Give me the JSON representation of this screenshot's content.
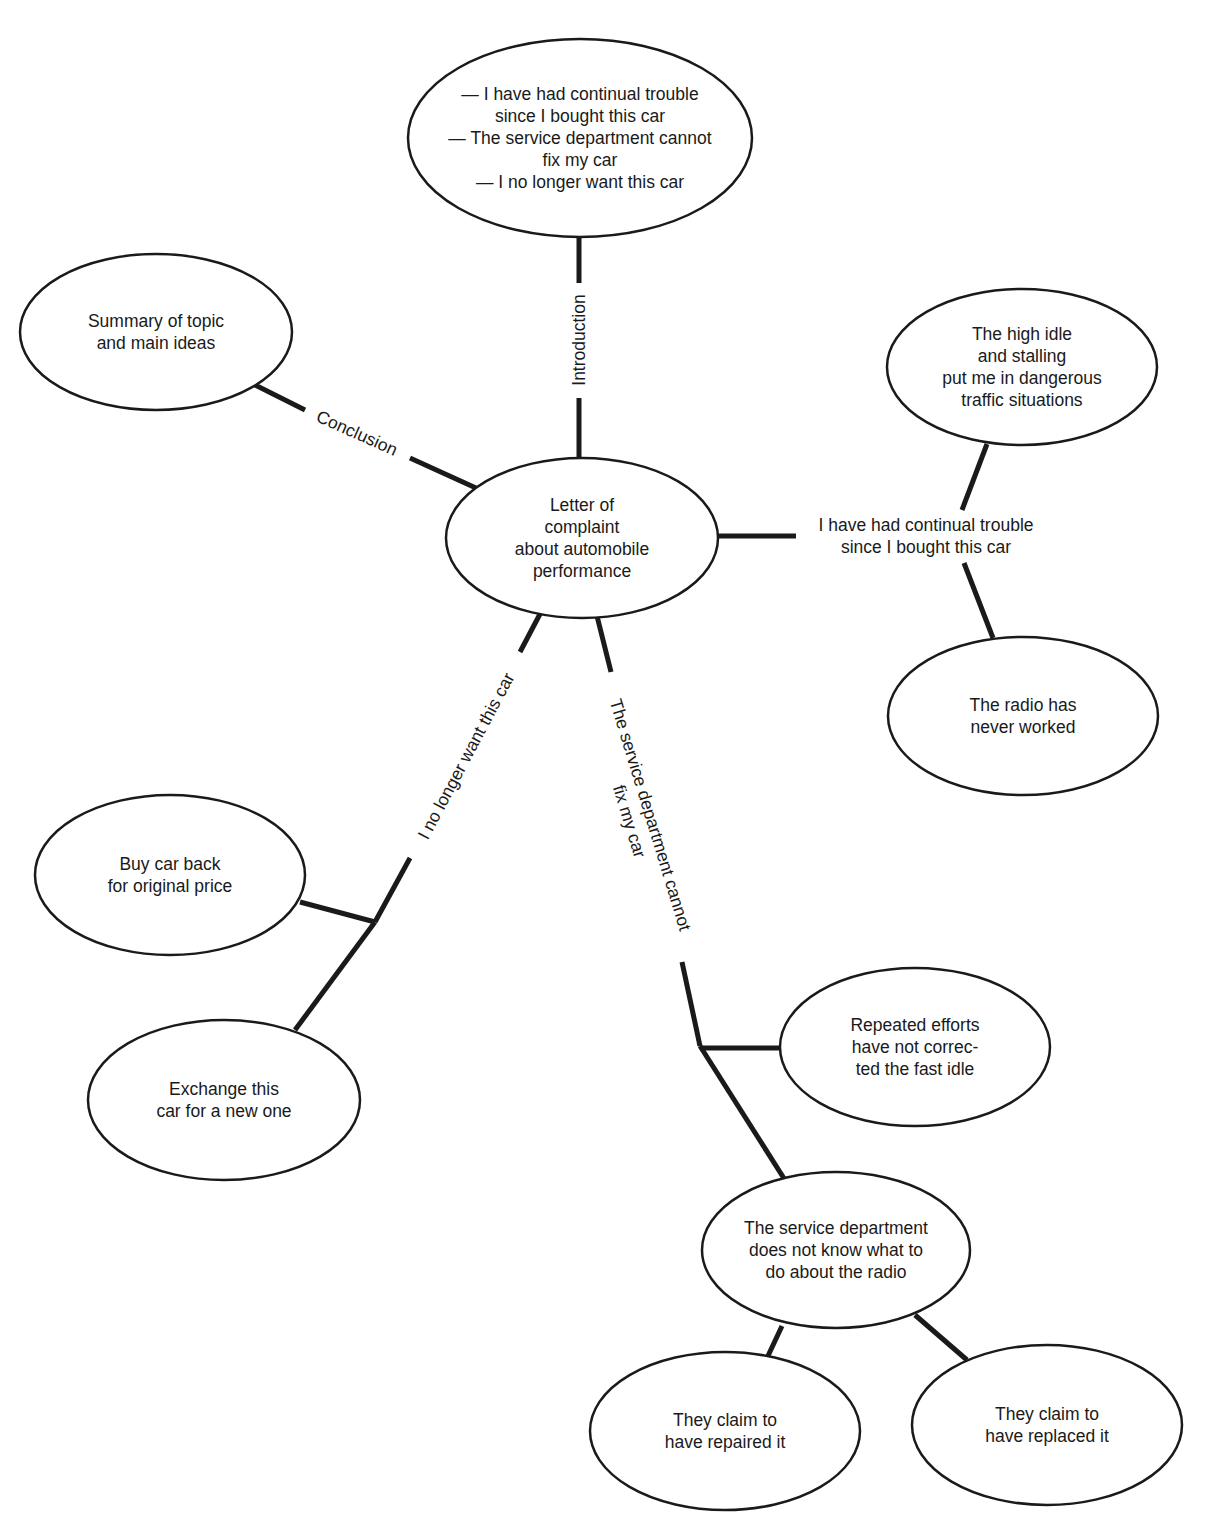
{
  "title": "",
  "center": {
    "label": "Letter of\ncomplaint\nabout automobile\nperformance"
  },
  "branches": {
    "introduction": {
      "label": "Introduction",
      "node": "— I have had continual trouble\nsince I bought this car\n— The service department cannot\nfix my car\n— I no longer want this car"
    },
    "conclusion": {
      "label": "Conclusion",
      "node": "Summary of topic\nand main ideas"
    },
    "trouble": {
      "label": "I have had continual trouble\nsince I bought this car",
      "children": [
        "The high idle\nand stalling\nput me in dangerous\ntraffic situations",
        "The radio has\nnever worked"
      ]
    },
    "no_longer_want": {
      "label": "I no longer want this car",
      "children": [
        "Buy car back\nfor original price",
        "Exchange this\ncar for a new one"
      ]
    },
    "service_cannot_fix": {
      "label": "The service department cannot\nfix my car",
      "children": [
        "Repeated efforts\nhave not correc-\nted the fast idle",
        "The service department\ndoes not know what to\ndo about the radio"
      ],
      "grandchildren": [
        "They claim to\nhave repaired it",
        "They claim to\nhave replaced it"
      ]
    }
  },
  "colors": {
    "stroke": "#1a1a1a",
    "background": "#ffffff"
  }
}
